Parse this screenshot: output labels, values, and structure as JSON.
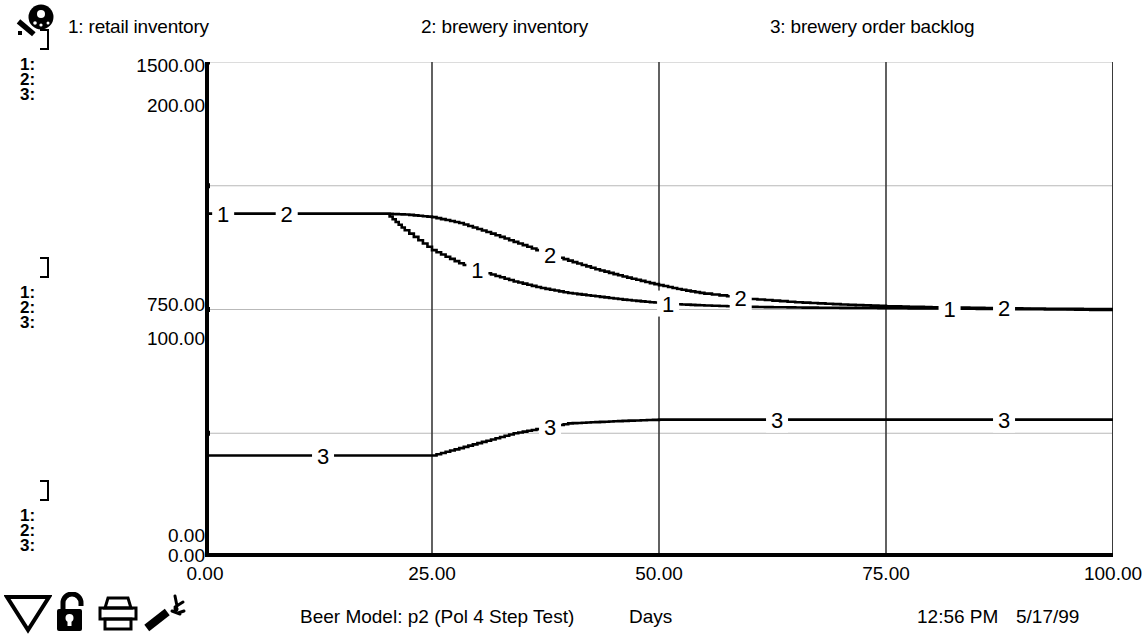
{
  "window": {
    "title": "Beer Model: p2 (Pol 4 Step Test)"
  },
  "legend": {
    "entries": [
      {
        "label": "1: retail inventory",
        "icon": "series-1"
      },
      {
        "label": "2: brewery inventory",
        "icon": "series-2"
      },
      {
        "label": "3: brewery order backlog",
        "icon": "series-3"
      }
    ],
    "key_icon": "key-icon"
  },
  "scale_stacks": {
    "top": {
      "row1": "1:",
      "row2": "2:",
      "row3": "3:"
    },
    "middle": {
      "row1": "1:",
      "row2": "2:",
      "row3": "3:"
    },
    "bottom": {
      "row1": "1:",
      "row2": "2:",
      "row3": "3:"
    }
  },
  "y_axis": {
    "top_primary": "1500.00",
    "top_secondary": "200.00",
    "mid_primary": "750.00",
    "mid_secondary": "100.00",
    "bottom_primary": "0.00",
    "bottom_secondary": "0.00"
  },
  "status": {
    "model": "Beer Model: p2 (Pol 4 Step Test)",
    "x_title": "Days",
    "time": "12:56 PM",
    "date": "5/17/99"
  },
  "toolbar": {
    "items": [
      {
        "name": "pointer-triangle-icon",
        "label": "Pointer"
      },
      {
        "name": "unlock-padlock-icon",
        "label": "Unlock"
      },
      {
        "name": "printer-icon",
        "label": "Print"
      },
      {
        "name": "magic-wand-icon",
        "label": "Magic Wand"
      }
    ]
  },
  "colors": {
    "ink": "#000000",
    "grid": "#b9b9b9",
    "background": "#ffffff"
  },
  "chart_data": {
    "type": "line",
    "title": "Beer Model: p2 (Pol 4 Step Test)",
    "xlabel": "Days",
    "ylabel": "",
    "grid": true,
    "legend_position": "top",
    "xlim": [
      0,
      100
    ],
    "xticks": [
      "0.00",
      "25.00",
      "50.00",
      "75.00",
      "100.00"
    ],
    "xtick_values": [
      0,
      25,
      50,
      75,
      100
    ],
    "axes": [
      {
        "id": "axis-1-2",
        "applies_to": [
          "retail inventory",
          "brewery inventory"
        ],
        "ylim": [
          0,
          1500
        ],
        "ytick_values": [
          0,
          375,
          750,
          1125,
          1500
        ],
        "labeled_ticks": {
          "0": "0.00",
          "750": "750.00",
          "1500": "1500.00"
        }
      },
      {
        "id": "axis-3",
        "applies_to": [
          "brewery order backlog"
        ],
        "ylim": [
          0,
          200
        ],
        "ytick_values": [
          0,
          50,
          100,
          150,
          200
        ],
        "labeled_ticks": {
          "0": "0.00",
          "100": "100.00",
          "200": "200.00"
        }
      }
    ],
    "series": [
      {
        "name": "retail inventory",
        "marker_label": "1",
        "axis": "axis-1-2",
        "marker_label_x": [
          2,
          30,
          51,
          82
        ],
        "x": [
          0,
          5,
          10,
          15,
          20,
          22,
          25,
          28,
          31,
          34,
          37,
          40,
          43,
          46,
          49,
          52,
          55,
          60,
          65,
          70,
          75,
          80,
          85,
          90,
          95,
          100
        ],
        "y": [
          1040,
          1040,
          1040,
          1040,
          1040,
          990,
          930,
          890,
          860,
          835,
          815,
          800,
          790,
          780,
          772,
          766,
          762,
          758,
          756,
          755,
          754,
          753,
          752,
          751,
          750,
          748
        ]
      },
      {
        "name": "brewery inventory",
        "marker_label": "2",
        "axis": "axis-1-2",
        "marker_label_x": [
          9,
          38,
          59,
          88
        ],
        "x": [
          0,
          5,
          10,
          15,
          20,
          22,
          25,
          28,
          31,
          34,
          37,
          40,
          43,
          46,
          49,
          52,
          55,
          60,
          65,
          70,
          75,
          80,
          85,
          90,
          95,
          100
        ],
        "y": [
          1040,
          1040,
          1040,
          1040,
          1040,
          1038,
          1030,
          1012,
          985,
          955,
          925,
          898,
          872,
          850,
          830,
          812,
          798,
          782,
          772,
          765,
          760,
          757,
          755,
          753,
          752,
          751
        ]
      },
      {
        "name": "brewery order backlog",
        "marker_label": "3",
        "axis": "axis-3",
        "marker_label_x": [
          13,
          38,
          63,
          88
        ],
        "x": [
          0,
          5,
          10,
          15,
          20,
          25,
          28,
          31,
          34,
          37,
          40,
          43,
          46,
          50,
          55,
          60,
          65,
          70,
          75,
          80,
          85,
          90,
          95,
          100
        ],
        "y": [
          41,
          41,
          41,
          41,
          41,
          41,
          44,
          47,
          50,
          52,
          54,
          54.5,
          55,
          55.5,
          55.5,
          55.5,
          55.5,
          55.5,
          55.5,
          55.5,
          55.5,
          55.5,
          55.5,
          55.5
        ]
      }
    ]
  }
}
